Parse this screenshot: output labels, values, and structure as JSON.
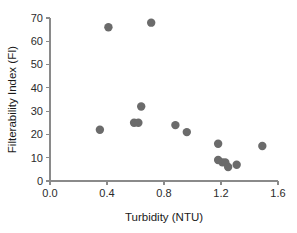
{
  "chart_data": {
    "type": "scatter",
    "title": "",
    "xlabel": "Turbidity (NTU)",
    "ylabel": "Filterability Index (FI)",
    "xlim": [
      0.0,
      1.6
    ],
    "ylim": [
      0,
      70
    ],
    "xticks": [
      "0.0",
      "0.4",
      "0.8",
      "1.2",
      "1.6"
    ],
    "xtick_values": [
      0.0,
      0.4,
      0.8,
      1.2,
      1.6
    ],
    "yticks": [
      "0",
      "10",
      "20",
      "30",
      "40",
      "50",
      "60",
      "70"
    ],
    "ytick_values": [
      0,
      10,
      20,
      30,
      40,
      50,
      60,
      70
    ],
    "grid": false,
    "legend": false,
    "marker_color": "#6b6b6b",
    "marker_size": 4.2,
    "axis_color": "#8a8a8a",
    "series": [
      {
        "name": "samples",
        "points": [
          {
            "x": 0.35,
            "y": 22
          },
          {
            "x": 0.41,
            "y": 66
          },
          {
            "x": 0.59,
            "y": 25
          },
          {
            "x": 0.62,
            "y": 25
          },
          {
            "x": 0.64,
            "y": 32
          },
          {
            "x": 0.71,
            "y": 68
          },
          {
            "x": 0.88,
            "y": 24
          },
          {
            "x": 0.96,
            "y": 21
          },
          {
            "x": 1.18,
            "y": 16
          },
          {
            "x": 1.18,
            "y": 9
          },
          {
            "x": 1.21,
            "y": 8
          },
          {
            "x": 1.23,
            "y": 8
          },
          {
            "x": 1.25,
            "y": 6
          },
          {
            "x": 1.31,
            "y": 7
          },
          {
            "x": 1.49,
            "y": 15
          }
        ]
      }
    ]
  }
}
